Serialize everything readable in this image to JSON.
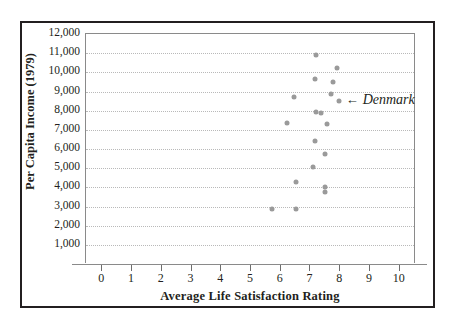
{
  "chart_data": {
    "type": "scatter",
    "title": "",
    "xlabel": "Average Life Satisfaction Rating",
    "ylabel": "Per Capita Income (1979)",
    "xlim": [
      -0.55,
      10.55
    ],
    "ylim": [
      0,
      12000
    ],
    "xticks": [
      0,
      1,
      2,
      3,
      4,
      5,
      6,
      7,
      8,
      9,
      10
    ],
    "xticklabels": [
      "0",
      "1",
      "2",
      "3",
      "4",
      "5",
      "6",
      "7",
      "8",
      "9",
      "10"
    ],
    "yticks": [
      1000,
      2000,
      3000,
      4000,
      5000,
      6000,
      7000,
      8000,
      9000,
      10000,
      11000,
      12000
    ],
    "yticklabels": [
      "1,000",
      "2,000",
      "3,000",
      "4,000",
      "5,000",
      "6,000",
      "7,000",
      "8,000",
      "9,000",
      "10,000",
      "11,000",
      "12,000"
    ],
    "grid": "horizontal-dotted",
    "legend": "none",
    "marker_color": "#9a9a9a",
    "points": [
      {
        "x": 5.7,
        "y": 2850
      },
      {
        "x": 6.5,
        "y": 2850
      },
      {
        "x": 6.5,
        "y": 4300
      },
      {
        "x": 6.2,
        "y": 7350
      },
      {
        "x": 6.45,
        "y": 8700
      },
      {
        "x": 7.1,
        "y": 5050
      },
      {
        "x": 7.15,
        "y": 6400
      },
      {
        "x": 7.2,
        "y": 7950
      },
      {
        "x": 7.15,
        "y": 9650
      },
      {
        "x": 7.2,
        "y": 10900
      },
      {
        "x": 7.35,
        "y": 7900
      },
      {
        "x": 7.5,
        "y": 3750
      },
      {
        "x": 7.5,
        "y": 4000
      },
      {
        "x": 7.5,
        "y": 5750
      },
      {
        "x": 7.55,
        "y": 7300
      },
      {
        "x": 7.7,
        "y": 8850
      },
      {
        "x": 7.75,
        "y": 9500
      },
      {
        "x": 7.9,
        "y": 10250
      },
      {
        "x": 7.95,
        "y": 8500
      }
    ],
    "annotations": [
      {
        "label": "Denmark",
        "target_x": 7.95,
        "target_y": 8500,
        "arrow": "←"
      }
    ]
  }
}
